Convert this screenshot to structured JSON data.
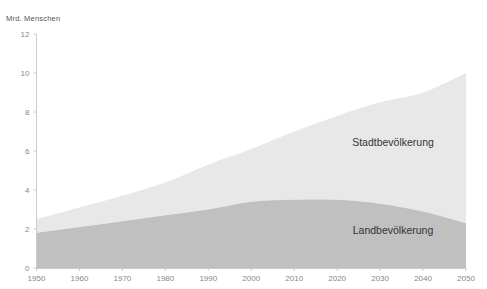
{
  "chart_data": {
    "type": "area",
    "stacked": true,
    "title": "",
    "subtitle": "",
    "xlabel": "",
    "ylabel": "Mrd. Menschen",
    "ylabel_position": "top-left",
    "grid": false,
    "legend_position": "inline-annotations",
    "x": [
      1950,
      1960,
      1970,
      1980,
      1990,
      2000,
      2010,
      2020,
      2030,
      2040,
      2050
    ],
    "xtick_labels": [
      "1950",
      "1960",
      "1970",
      "1980",
      "1990",
      "2000",
      "2010",
      "2020",
      "2030",
      "2040",
      "2050"
    ],
    "ytick_labels": [
      "0",
      "2",
      "4",
      "6",
      "8",
      "10",
      "12"
    ],
    "yticks": [
      0,
      2,
      4,
      6,
      8,
      10,
      12
    ],
    "xlim": [
      1950,
      2050
    ],
    "ylim": [
      0,
      12
    ],
    "series": [
      {
        "name": "Landbevölkerung",
        "color": "#c0c0c0",
        "stack_order": 0,
        "values": [
          1.8,
          2.1,
          2.4,
          2.7,
          3.0,
          3.4,
          3.5,
          3.5,
          3.3,
          2.9,
          2.3
        ]
      },
      {
        "name": "Stadtbevölkerung",
        "color": "#e8e8e8",
        "stack_order": 1,
        "values": [
          0.7,
          1.0,
          1.3,
          1.7,
          2.3,
          2.7,
          3.5,
          4.3,
          5.2,
          6.1,
          7.7
        ]
      }
    ],
    "totals": [
      2.5,
      3.1,
      3.7,
      4.4,
      5.3,
      6.1,
      7.0,
      7.8,
      8.5,
      9.0,
      10.0
    ],
    "annotations": [
      {
        "text": "Stadtbevölkerung",
        "x": 393,
        "y": 146
      },
      {
        "text": "Landbevölkerung",
        "x": 393,
        "y": 234
      }
    ]
  },
  "axis": {
    "y_label": "Mrd. Menschen"
  },
  "colors": {
    "urban": "#e8e8e8",
    "rural": "#c0c0c0",
    "axis": "#cccccc",
    "tick_text": "#888888",
    "label_text": "#333333",
    "background": "#ffffff"
  }
}
